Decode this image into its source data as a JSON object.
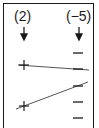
{
  "diagram": {
    "left_label": "(2)",
    "right_label": "(−5)",
    "left_symbol": "+",
    "right_symbol": "−",
    "left_count": 2,
    "right_count": 5,
    "line_color": "#555555",
    "symbol_color": "#1a1a1a"
  }
}
